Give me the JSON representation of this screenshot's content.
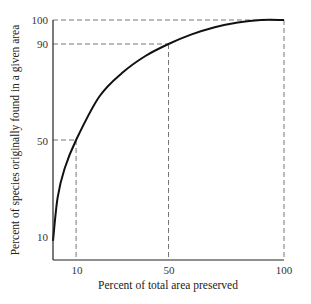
{
  "chart_data": {
    "type": "line",
    "title": "",
    "xlabel": "Percent of total area preserved",
    "ylabel": "Percent of species originally found in a given area",
    "xlim": [
      0,
      100
    ],
    "ylim": [
      0,
      100
    ],
    "x_ticks": [
      10,
      50,
      100
    ],
    "y_ticks": [
      10,
      50,
      90,
      100
    ],
    "grid": false,
    "series": [
      {
        "name": "species-area curve",
        "x": [
          0,
          2,
          5,
          10,
          20,
          30,
          40,
          50,
          60,
          70,
          80,
          90,
          100
        ],
        "y": [
          8,
          26,
          38,
          50,
          68,
          78,
          85,
          90,
          94,
          97,
          99,
          100,
          100
        ]
      }
    ],
    "reference_lines": [
      {
        "x": 10,
        "y": 50
      },
      {
        "x": 50,
        "y": 90
      },
      {
        "x": 100,
        "y": 100
      }
    ]
  },
  "labels": {
    "x_ticks": [
      "10",
      "50",
      "100"
    ],
    "y_ticks": [
      "10",
      "50",
      "90",
      "100"
    ],
    "xlabel": "Percent of total area preserved",
    "ylabel": "Percent of species originally found in a given area"
  }
}
